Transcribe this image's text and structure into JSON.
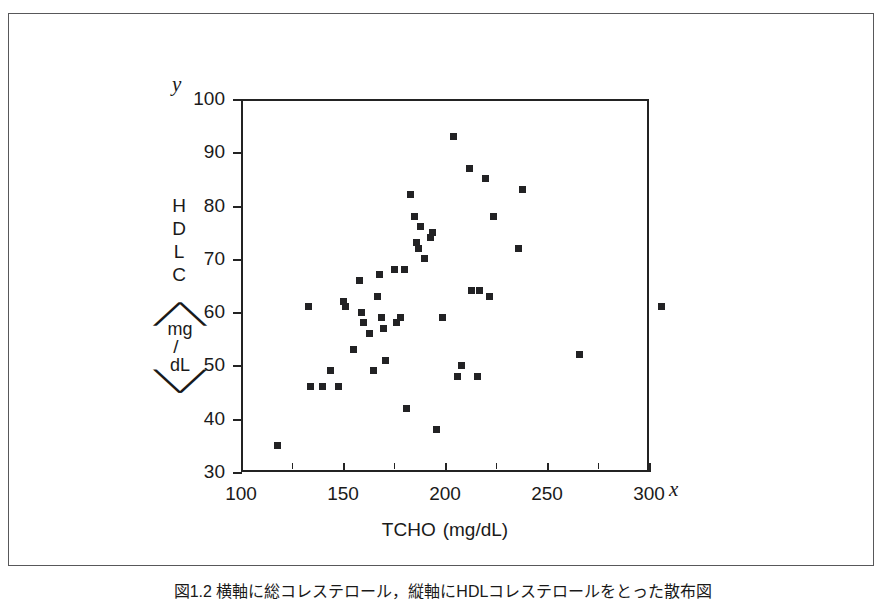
{
  "figure": {
    "caption": "図1.2  横軸に総コレステロール，縦軸にHDLコレステロールをとった散布図"
  },
  "axes": {
    "x_variable_letter": "x",
    "y_variable_letter": "y",
    "x_title_main": "TCHO",
    "x_title_unit": "(mg/dL)",
    "y_title_letters": [
      "H",
      "D",
      "L",
      "C"
    ],
    "y_title_unit_num": "mg",
    "y_title_unit_slash": "/",
    "y_title_unit_den": "dL",
    "y_tick_labels": [
      "100",
      "90",
      "80",
      "70",
      "60",
      "50",
      "40",
      "30"
    ],
    "x_tick_labels": [
      "100",
      "150",
      "200",
      "250",
      "300"
    ]
  },
  "chart_data": {
    "type": "scatter",
    "title": "",
    "xlabel": "TCHO (mg/dL)",
    "ylabel": "HDLC (mg/dL)",
    "xlim": [
      100,
      310
    ],
    "ylim": [
      30,
      100
    ],
    "xticks": [
      100,
      150,
      200,
      250,
      300
    ],
    "xticks_minor": [
      125,
      175,
      225,
      275
    ],
    "yticks": [
      30,
      40,
      50,
      60,
      70,
      80,
      90,
      100
    ],
    "grid": false,
    "legend": null,
    "marker": "square",
    "marker_color": "#222224",
    "n_points": 46,
    "points": [
      {
        "x": 118,
        "y": 35
      },
      {
        "x": 133,
        "y": 61
      },
      {
        "x": 134,
        "y": 46
      },
      {
        "x": 140,
        "y": 46
      },
      {
        "x": 144,
        "y": 49
      },
      {
        "x": 148,
        "y": 46
      },
      {
        "x": 150,
        "y": 62
      },
      {
        "x": 151,
        "y": 61
      },
      {
        "x": 155,
        "y": 53
      },
      {
        "x": 158,
        "y": 66
      },
      {
        "x": 159,
        "y": 60
      },
      {
        "x": 160,
        "y": 58
      },
      {
        "x": 163,
        "y": 56
      },
      {
        "x": 165,
        "y": 49
      },
      {
        "x": 167,
        "y": 63
      },
      {
        "x": 168,
        "y": 67
      },
      {
        "x": 169,
        "y": 59
      },
      {
        "x": 170,
        "y": 57
      },
      {
        "x": 171,
        "y": 51
      },
      {
        "x": 175,
        "y": 68
      },
      {
        "x": 176,
        "y": 58
      },
      {
        "x": 178,
        "y": 59
      },
      {
        "x": 180,
        "y": 68
      },
      {
        "x": 181,
        "y": 42
      },
      {
        "x": 183,
        "y": 82
      },
      {
        "x": 185,
        "y": 78
      },
      {
        "x": 186,
        "y": 73
      },
      {
        "x": 187,
        "y": 72
      },
      {
        "x": 188,
        "y": 76
      },
      {
        "x": 190,
        "y": 70
      },
      {
        "x": 193,
        "y": 74
      },
      {
        "x": 194,
        "y": 75
      },
      {
        "x": 196,
        "y": 38
      },
      {
        "x": 199,
        "y": 59
      },
      {
        "x": 204,
        "y": 93
      },
      {
        "x": 206,
        "y": 48
      },
      {
        "x": 208,
        "y": 50
      },
      {
        "x": 212,
        "y": 87
      },
      {
        "x": 213,
        "y": 64
      },
      {
        "x": 216,
        "y": 48
      },
      {
        "x": 217,
        "y": 64
      },
      {
        "x": 220,
        "y": 85
      },
      {
        "x": 222,
        "y": 63
      },
      {
        "x": 224,
        "y": 78
      },
      {
        "x": 236,
        "y": 72
      },
      {
        "x": 238,
        "y": 83
      },
      {
        "x": 266,
        "y": 52
      },
      {
        "x": 306,
        "y": 61
      }
    ]
  }
}
